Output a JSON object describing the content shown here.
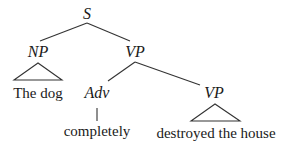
{
  "tree": {
    "root": {
      "label": "S"
    },
    "np": {
      "label": "NP",
      "yield": "The dog"
    },
    "vp": {
      "label": "VP"
    },
    "adv": {
      "label": "Adv",
      "yield": "completely"
    },
    "vp2": {
      "label": "VP",
      "yield": "destroyed the house"
    }
  },
  "colors": {
    "ink": "#1a1a1a",
    "lines": "#333333",
    "background": "#ffffff"
  }
}
